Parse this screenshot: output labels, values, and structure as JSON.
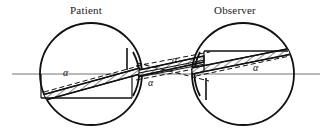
{
  "figure": {
    "title_left": "Patient",
    "title_right": "Observer",
    "background_color": "#ffffff",
    "ink_color": "#111111",
    "axis_color": "#707070",
    "symbols": {
      "alpha": "α"
    },
    "labels": [
      {
        "id": "label-patient",
        "text": "Patient",
        "x": 70,
        "y": 4
      },
      {
        "id": "label-observer",
        "text": "Observer",
        "x": 214,
        "y": 4
      }
    ],
    "angle_labels": [
      {
        "id": "alpha-patient",
        "text": "α",
        "x": 63,
        "y": 68
      },
      {
        "id": "alpha-mid-top",
        "text": "α",
        "x": 172,
        "y": 55
      },
      {
        "id": "alpha-mid-bot",
        "text": "α",
        "x": 148,
        "y": 78
      },
      {
        "id": "alpha-observer",
        "text": "α",
        "x": 253,
        "y": 63
      }
    ],
    "eyes": [
      {
        "name": "patient-eye",
        "cx": 91,
        "cy": 74,
        "r": 51
      },
      {
        "name": "observer-eye",
        "cx": 243,
        "cy": 74,
        "r": 51
      }
    ],
    "optical_axis": {
      "x1": 12,
      "y1": 74,
      "x2": 320,
      "y2": 74
    }
  }
}
